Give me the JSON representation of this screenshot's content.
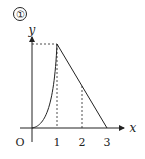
{
  "diagram": {
    "label": "①",
    "axes": {
      "x_label": "x",
      "y_label": "y",
      "origin_label": "O"
    },
    "x_ticks": [
      "1",
      "2",
      "3"
    ],
    "colors": {
      "stroke": "#222222",
      "background": "#ffffff"
    }
  }
}
